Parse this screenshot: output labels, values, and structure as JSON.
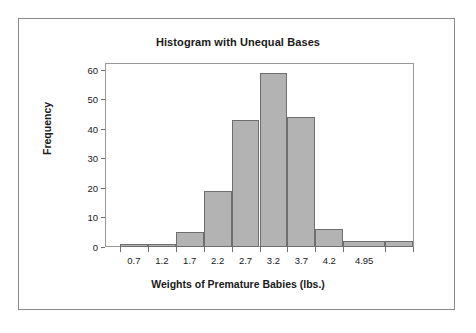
{
  "figure": {
    "background_color": "#ffffff",
    "border_color": "#8a8a8a"
  },
  "chart_data": {
    "type": "bar",
    "title": "Histogram with Unequal Bases",
    "xlabel": "Weights of Premature Babies (lbs.)",
    "ylabel": "Frequency",
    "ylim": [
      0,
      62
    ],
    "yticks": [
      0,
      10,
      20,
      30,
      40,
      50,
      60
    ],
    "ytick_labels": [
      "0",
      "10",
      "20",
      "30",
      "40",
      "50",
      "60"
    ],
    "xtick_labels": [
      "0.7",
      "1.2",
      "1.7",
      "2.2",
      "2.7",
      "3.2",
      "3.7",
      "4.2",
      "4.95"
    ],
    "xtick_values": [
      0.7,
      1.2,
      1.7,
      2.2,
      2.7,
      3.2,
      3.7,
      4.2,
      4.95
    ],
    "xlim": [
      0.2,
      5.7
    ],
    "grid": false,
    "legend": null,
    "bar_color": "#b3b3b3",
    "bar_edge_color": "#6e6e6e",
    "note": "Unequal class widths: final two classes are wider than the rest",
    "bins": [
      {
        "left": 0.45,
        "right": 0.95,
        "label": "0.7",
        "frequency": 1
      },
      {
        "left": 0.95,
        "right": 1.45,
        "label": "1.2",
        "frequency": 1
      },
      {
        "left": 1.45,
        "right": 1.95,
        "label": "1.7",
        "frequency": 5
      },
      {
        "left": 1.95,
        "right": 2.45,
        "label": "2.2",
        "frequency": 19
      },
      {
        "left": 2.45,
        "right": 2.95,
        "label": "2.7",
        "frequency": 43
      },
      {
        "left": 2.95,
        "right": 3.45,
        "label": "3.2",
        "frequency": 59
      },
      {
        "left": 3.45,
        "right": 3.95,
        "label": "3.7",
        "frequency": 44
      },
      {
        "left": 3.95,
        "right": 4.45,
        "label": "4.2",
        "frequency": 6
      },
      {
        "left": 4.45,
        "right": 5.2,
        "label": "4.95",
        "frequency": 2
      },
      {
        "left": 5.2,
        "right": 5.7,
        "label": "5.45",
        "frequency": 2
      }
    ],
    "categories": [
      "0.7",
      "1.2",
      "1.7",
      "2.2",
      "2.7",
      "3.2",
      "3.7",
      "4.2",
      "4.95",
      "5.45"
    ],
    "values": [
      1,
      1,
      5,
      19,
      43,
      59,
      44,
      6,
      2,
      2
    ]
  }
}
